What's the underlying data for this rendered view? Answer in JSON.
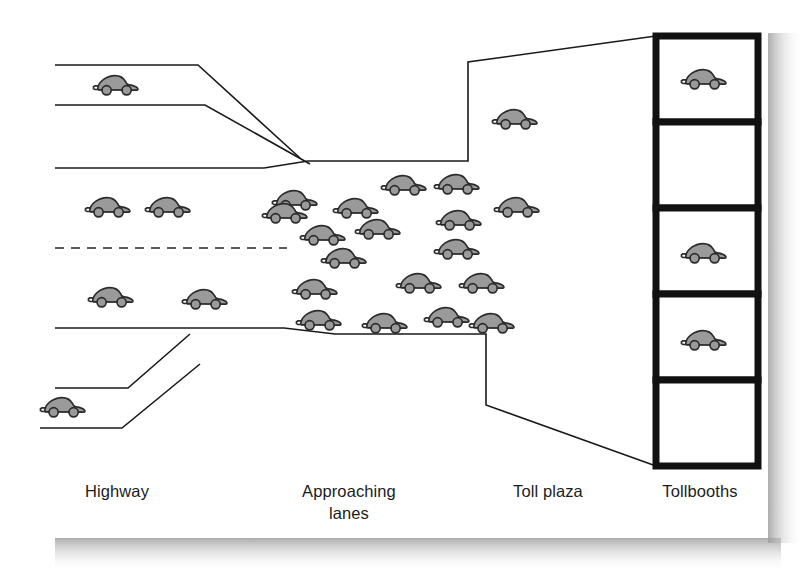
{
  "figure": {
    "background_color": "#ffffff",
    "card_color": "#ffffff",
    "shadow_color": "#b4b4b4",
    "line_color": "#1a1a1a",
    "car_fill_color": "#9a9a9a",
    "car_stroke_color": "#2b2b2b",
    "booth_stroke_color": "#111111"
  },
  "labels": {
    "highway": "Highway",
    "approaching_lanes_line1": "Approaching",
    "approaching_lanes_line2": "lanes",
    "toll_plaza": "Toll plaza",
    "tollbooths": "Tollbooths"
  },
  "tollbooths": {
    "count": 5,
    "occupied": [
      true,
      false,
      true,
      true,
      false
    ],
    "cells": [
      {
        "index": 1,
        "state": "occupied"
      },
      {
        "index": 2,
        "state": "empty"
      },
      {
        "index": 3,
        "state": "occupied"
      },
      {
        "index": 4,
        "state": "occupied"
      },
      {
        "index": 5,
        "state": "empty"
      }
    ]
  },
  "car_counts": {
    "highway_upper_ramp": 1,
    "highway_upper_lane": 2,
    "highway_lower_lane": 2,
    "highway_lower_ramp": 1,
    "approaching_lanes_queue": 18,
    "toll_plaza": 1,
    "tollbooths": 3,
    "total": 28
  },
  "cars": {
    "highway": [
      {
        "x": 93,
        "y": 68,
        "scale": 1.0,
        "zone": "upper-ramp"
      },
      {
        "x": 85,
        "y": 190,
        "scale": 1.0,
        "zone": "upper-lane"
      },
      {
        "x": 145,
        "y": 190,
        "scale": 1.0,
        "zone": "upper-lane"
      },
      {
        "x": 88,
        "y": 280,
        "scale": 1.0,
        "zone": "lower-lane"
      },
      {
        "x": 182,
        "y": 282,
        "scale": 1.0,
        "zone": "lower-lane"
      },
      {
        "x": 40,
        "y": 390,
        "scale": 1.0,
        "zone": "lower-ramp"
      }
    ],
    "queue": [
      {
        "x": 272,
        "y": 183,
        "scale": 1.0
      },
      {
        "x": 333,
        "y": 191,
        "scale": 1.0
      },
      {
        "x": 381,
        "y": 168,
        "scale": 1.0
      },
      {
        "x": 434,
        "y": 167,
        "scale": 1.0
      },
      {
        "x": 300,
        "y": 218,
        "scale": 1.0
      },
      {
        "x": 355,
        "y": 212,
        "scale": 1.0
      },
      {
        "x": 436,
        "y": 203,
        "scale": 1.0
      },
      {
        "x": 321,
        "y": 241,
        "scale": 1.0
      },
      {
        "x": 434,
        "y": 232,
        "scale": 1.0
      },
      {
        "x": 292,
        "y": 272,
        "scale": 1.0
      },
      {
        "x": 396,
        "y": 266,
        "scale": 1.0
      },
      {
        "x": 459,
        "y": 266,
        "scale": 1.0
      },
      {
        "x": 296,
        "y": 303,
        "scale": 1.0
      },
      {
        "x": 362,
        "y": 306,
        "scale": 1.0
      },
      {
        "x": 424,
        "y": 300,
        "scale": 1.0
      },
      {
        "x": 469,
        "y": 306,
        "scale": 1.0
      },
      {
        "x": 262,
        "y": 196,
        "scale": 1.0
      },
      {
        "x": 494,
        "y": 190,
        "scale": 1.0
      }
    ],
    "plaza": [
      {
        "x": 492,
        "y": 102,
        "scale": 1.0
      }
    ],
    "booths": [
      {
        "x": 681,
        "y": 62,
        "scale": 1.0,
        "booth": 1
      },
      {
        "x": 681,
        "y": 236,
        "scale": 1.0,
        "booth": 3
      },
      {
        "x": 681,
        "y": 323,
        "scale": 1.0,
        "booth": 4
      }
    ]
  },
  "geometry": {
    "card": {
      "x": 40,
      "y": 18,
      "width": 728,
      "height": 520
    },
    "booth_column": {
      "x": 656,
      "y": 36,
      "width": 102,
      "height": 430,
      "cell_height": 86
    },
    "highway_lines": [
      {
        "name": "upper-ramp-top",
        "y": 65,
        "x1": 55,
        "x2": 198
      },
      {
        "name": "upper-ramp-bottom",
        "y": 105,
        "x1": 55,
        "x2": 205
      },
      {
        "name": "upper-shoulder",
        "y": 168,
        "x1": 55,
        "x2": 264
      },
      {
        "name": "center-dashed",
        "y": 248,
        "x1": 55,
        "x2": 287
      },
      {
        "name": "lower-shoulder",
        "y": 328,
        "x1": 55,
        "x2": 284
      },
      {
        "name": "lower-ramp-top",
        "y": 388,
        "x1": 55,
        "x2": 128
      },
      {
        "name": "lower-ramp-bottom",
        "y": 428,
        "x1": 40,
        "x2": 122
      }
    ]
  }
}
